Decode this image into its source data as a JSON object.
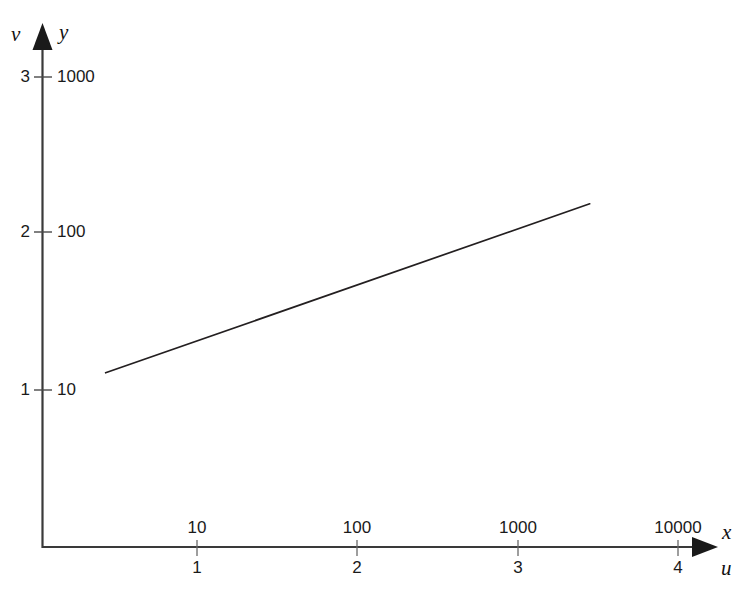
{
  "chart_data": {
    "type": "line",
    "title": "",
    "subtitle": "",
    "grid": false,
    "legend": null,
    "axes": {
      "x_outer": {
        "label": "u",
        "kind": "linear",
        "ticks": [
          1,
          2,
          3,
          4
        ],
        "tick_labels": [
          "1",
          "2",
          "3",
          "4"
        ],
        "range": [
          0.0,
          4.16
        ]
      },
      "x_inner": {
        "label": "x",
        "kind": "log10",
        "ticks": [
          10,
          100,
          1000,
          10000
        ],
        "tick_labels": [
          "10",
          "100",
          "1000",
          "10000"
        ]
      },
      "y_outer": {
        "label": "v",
        "kind": "linear",
        "ticks": [
          1,
          2,
          3
        ],
        "tick_labels": [
          "1",
          "2",
          "3"
        ],
        "range": [
          0.0,
          3.18
        ]
      },
      "y_inner": {
        "label": "y",
        "kind": "log10",
        "ticks": [
          10,
          100,
          1000
        ],
        "tick_labels": [
          "10",
          "100",
          "1000"
        ]
      }
    },
    "series": [
      {
        "name": "line",
        "color": "#231f20",
        "width_px": 1.7,
        "points_uv": [
          [
            0.43,
            1.11
          ],
          [
            3.45,
            2.19
          ]
        ],
        "points_xy": [
          [
            2.7,
            12.9
          ],
          [
            2818.0,
            155.0
          ]
        ],
        "slope_uv": 0.358,
        "intercept_uv": 0.956
      }
    ]
  },
  "y_axis": {
    "var_outer": "v",
    "var_inner": "y",
    "ticks": [
      {
        "outer": "3",
        "inner": "1000"
      },
      {
        "outer": "2",
        "inner": "100"
      },
      {
        "outer": "1",
        "inner": "10"
      }
    ]
  },
  "x_axis": {
    "var_outer": "u",
    "var_inner": "x",
    "ticks": [
      {
        "inner": "10",
        "outer": "1"
      },
      {
        "inner": "100",
        "outer": "2"
      },
      {
        "inner": "1000",
        "outer": "3"
      },
      {
        "inner": "10000",
        "outer": "4"
      }
    ]
  },
  "colors": {
    "axis": "#3a3a3a",
    "data_line": "#231f20",
    "text": "#1a1a1a",
    "background": "#ffffff"
  },
  "icons": {
    "y_axis_arrow": "arrow-up-icon",
    "x_axis_arrow": "arrow-right-icon"
  }
}
